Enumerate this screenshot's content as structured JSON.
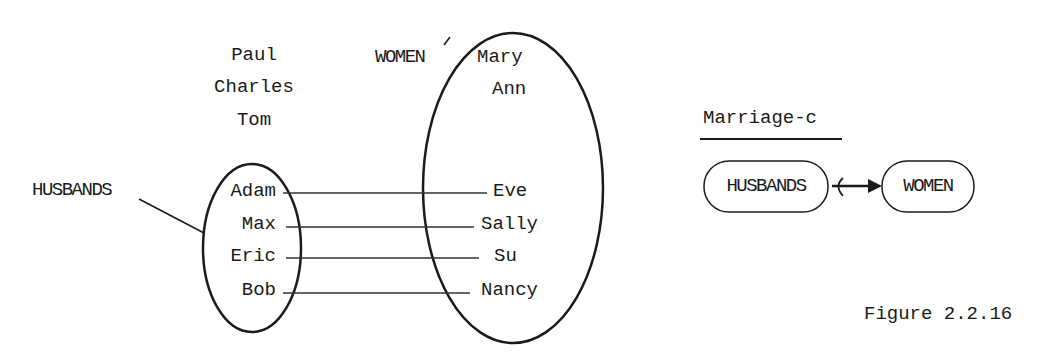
{
  "diagram": {
    "unmarried_men": [
      "Paul",
      "Charles",
      "Tom"
    ],
    "husbands_label": "HUSBANDS",
    "husbands": [
      "Adam",
      "Max",
      "Eric",
      "Bob"
    ],
    "women_label": "WOMEN",
    "unmarried_women": [
      "Mary",
      "Ann"
    ],
    "wives": [
      "Eve",
      "Sally",
      "Su",
      "Nancy"
    ],
    "pairs": [
      {
        "husband": "Adam",
        "wife": "Eve"
      },
      {
        "husband": "Max",
        "wife": "Sally"
      },
      {
        "husband": "Eric",
        "wife": "Su"
      },
      {
        "husband": "Bob",
        "wife": "Nancy"
      }
    ]
  },
  "schema": {
    "title": "Marriage-c",
    "left_entity": "HUSBANDS",
    "right_entity": "WOMEN"
  },
  "caption": "Figure 2.2.16"
}
